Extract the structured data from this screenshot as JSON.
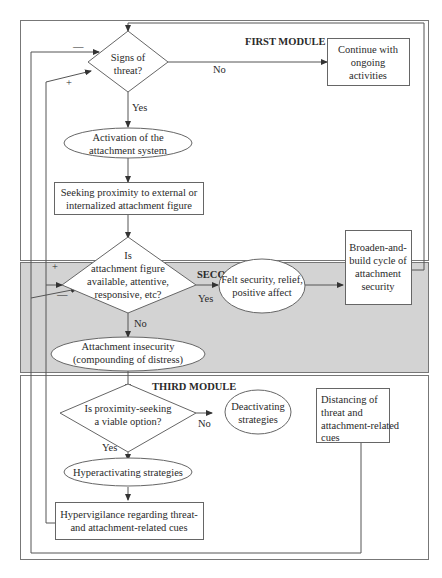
{
  "modules": {
    "first": {
      "title": "FIRST MODULE"
    },
    "second": {
      "title": "SECOND MODULE",
      "background": "#d3d3d3"
    },
    "third": {
      "title": "THIRD MODULE"
    }
  },
  "nodes": {
    "signs_of_threat": {
      "shape": "diamond",
      "lines": [
        "Signs of",
        "threat?"
      ]
    },
    "continue_ongoing": {
      "shape": "rect",
      "lines": [
        "Continue with",
        "ongoing",
        "activities"
      ]
    },
    "activation": {
      "shape": "ellipse",
      "lines": [
        "Activation of the",
        "attachment system"
      ]
    },
    "seeking_proximity": {
      "shape": "rect",
      "lines": [
        "Seeking proximity to external or",
        "internalized attachment figure"
      ]
    },
    "figure_available": {
      "shape": "diamond",
      "lines": [
        "Is",
        "attachment figure",
        "available, attentive,",
        "responsive, etc?"
      ]
    },
    "felt_security": {
      "shape": "ellipse",
      "lines": [
        "Felt security, relief,",
        "positive affect"
      ]
    },
    "broaden_build": {
      "shape": "rect",
      "lines": [
        "Broaden-and-",
        "build cycle of",
        "attachment",
        "security"
      ]
    },
    "insecurity": {
      "shape": "ellipse",
      "lines": [
        "Attachment insecurity",
        "(compounding of distress)"
      ]
    },
    "proximity_viable": {
      "shape": "diamond",
      "lines": [
        "Is proximity-seeking",
        "a viable option?"
      ]
    },
    "deactivating": {
      "shape": "ellipse",
      "lines": [
        "Deactivating",
        "strategies"
      ]
    },
    "distancing": {
      "shape": "rect",
      "lines": [
        "Distancing of",
        "threat and",
        "attachment-related",
        "cues"
      ]
    },
    "hyperactivating": {
      "shape": "ellipse",
      "lines": [
        "Hyperactivating strategies"
      ]
    },
    "hypervigilance": {
      "shape": "rect",
      "lines": [
        "Hypervigilance regarding threat-",
        "and attachment-related cues"
      ]
    }
  },
  "edge_labels": {
    "threat_no": "No",
    "threat_yes": "Yes",
    "available_yes": "Yes",
    "available_no": "No",
    "viable_no": "No",
    "viable_yes": "Yes",
    "minus_top": "—",
    "plus_top": "+",
    "plus_second": "+",
    "minus_second": "—"
  }
}
